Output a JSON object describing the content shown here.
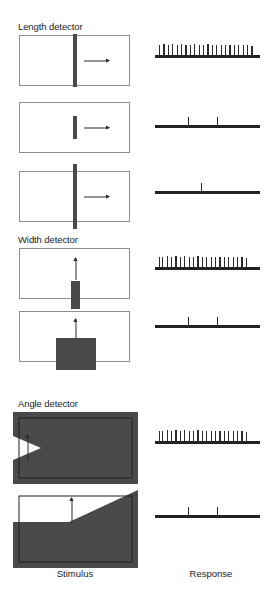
{
  "figure": {
    "axis_labels": {
      "stimulus": "Stimulus",
      "response": "Response"
    },
    "colors": {
      "shape_fill": "#4a4a4a",
      "panel_border": "#8e8e8e",
      "trace": "#222222",
      "background": "#ffffff"
    },
    "sections": [
      {
        "id": "length-detector",
        "title": "Length detector",
        "rows": [
          {
            "id": "length-row-1",
            "stimulus": {
              "shape": "vertical-bar-full-height",
              "motion": "rightward",
              "arrow_direction": "right"
            },
            "response": {
              "firing": "high",
              "spike_count": 22
            }
          },
          {
            "id": "length-row-2",
            "stimulus": {
              "shape": "vertical-bar-short",
              "motion": "rightward",
              "arrow_direction": "right"
            },
            "response": {
              "firing": "low",
              "spike_count": 2
            }
          },
          {
            "id": "length-row-3",
            "stimulus": {
              "shape": "vertical-bar-overextended",
              "motion": "rightward",
              "arrow_direction": "right"
            },
            "response": {
              "firing": "very-low",
              "spike_count": 1
            }
          }
        ]
      },
      {
        "id": "width-detector",
        "title": "Width detector",
        "rows": [
          {
            "id": "width-row-1",
            "stimulus": {
              "shape": "narrow-vertical-bar",
              "motion": "upward",
              "arrow_direction": "up"
            },
            "response": {
              "firing": "high",
              "spike_count": 21
            }
          },
          {
            "id": "width-row-2",
            "stimulus": {
              "shape": "wide-block",
              "motion": "upward",
              "arrow_direction": "up"
            },
            "response": {
              "firing": "low",
              "spike_count": 2
            }
          }
        ]
      },
      {
        "id": "angle-detector",
        "title": "Angle detector",
        "rows": [
          {
            "id": "angle-row-1",
            "stimulus": {
              "shape": "dark-field-with-v-notch",
              "motion": "upward",
              "arrow_direction": "up"
            },
            "response": {
              "firing": "high",
              "spike_count": 21
            }
          },
          {
            "id": "angle-row-2",
            "stimulus": {
              "shape": "dark-field-with-diagonal-ramp",
              "motion": "upward",
              "arrow_direction": "up"
            },
            "response": {
              "firing": "low",
              "spike_count": 2
            }
          }
        ]
      }
    ]
  },
  "chart_data": {
    "type": "table",
    "xlabel": "Stimulus",
    "ylabel": "Response",
    "categories": [
      "Length detector / full-length bar",
      "Length detector / short bar",
      "Length detector / over-long bar",
      "Width detector / narrow bar",
      "Width detector / wide block",
      "Angle detector / V notch",
      "Angle detector / diagonal ramp"
    ],
    "series": [
      {
        "name": "Spike count",
        "values": [
          22,
          2,
          1,
          21,
          2,
          21,
          2
        ]
      }
    ],
    "legend": [],
    "grid": false
  },
  "spike_trains": {
    "dense_22": {
      "positions": [
        4,
        8.4,
        12.8,
        17.2,
        21.6,
        26,
        30.4,
        34.8,
        39.2,
        43.6,
        48,
        52.4,
        56.8,
        61.2,
        65.6,
        70,
        74.4,
        78.8,
        83.2,
        87.6,
        92,
        96.4
      ],
      "heights": [
        11,
        11.5,
        11,
        11.5,
        11,
        11.5,
        11,
        11,
        11.5,
        11,
        11,
        11.5,
        11,
        11,
        10.5,
        11,
        10.5,
        11,
        10.5,
        10.5,
        10.5,
        10
      ]
    },
    "dense_21_burst": {
      "positions": [
        4,
        7.2,
        11.6,
        16,
        20.4,
        24.8,
        29.2,
        33.6,
        38,
        42.4,
        46.8,
        51.2,
        55.6,
        60,
        64.4,
        68.8,
        73.2,
        77.6,
        82,
        86.4,
        90.8
      ],
      "heights": [
        11,
        11,
        11.5,
        11,
        11.5,
        11,
        11.5,
        11,
        11,
        11.5,
        11,
        11,
        11,
        11,
        10.5,
        11,
        10.5,
        10.5,
        10.5,
        10.5,
        10
      ]
    },
    "sparse_2": {
      "positions": [
        33,
        62
      ],
      "heights": [
        9,
        9
      ]
    },
    "sparse_1": {
      "positions": [
        46
      ],
      "heights": [
        9
      ]
    }
  }
}
